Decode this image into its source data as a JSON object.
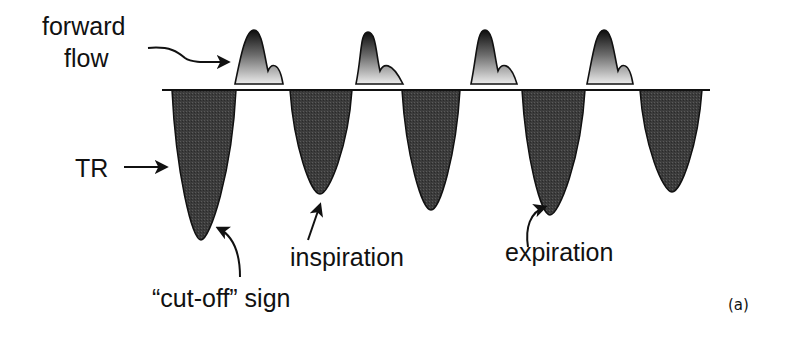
{
  "figure": {
    "panel_label": "(a)",
    "labels": {
      "forward_flow_line1": "forward",
      "forward_flow_line2": "flow",
      "tr": "TR",
      "cut_off_sign": "“cut-off” sign",
      "inspiration": "inspiration",
      "expiration": "expiration"
    },
    "colors": {
      "trough_fill": "#3a3a3a",
      "peak_fill_top": "#111111",
      "peak_fill_bottom": "#e6e6e6",
      "line": "#111111",
      "background": "#ffffff"
    },
    "baseline": {
      "x_start": 162,
      "x_end": 710,
      "y": 90
    },
    "forward_flow_peaks": [
      {
        "left": 235,
        "peak_x": 254,
        "peak_y": 30,
        "notch_x": 268,
        "hump_x": 276,
        "right": 283
      },
      {
        "left": 356,
        "peak_x": 368,
        "peak_y": 32,
        "notch_x": 380,
        "hump_x": 388,
        "right": 403
      },
      {
        "left": 471,
        "peak_x": 485,
        "peak_y": 30,
        "notch_x": 498,
        "hump_x": 507,
        "right": 517
      },
      {
        "left": 587,
        "peak_x": 604,
        "peak_y": 30,
        "notch_x": 618,
        "hump_x": 626,
        "right": 633
      }
    ],
    "tr_troughs": [
      {
        "left": 172,
        "right": 236,
        "bottom_x": 201,
        "bottom_y": 240,
        "note": "cut-off sign"
      },
      {
        "left": 290,
        "right": 352,
        "bottom_x": 320,
        "bottom_y": 194,
        "note": "inspiration"
      },
      {
        "left": 402,
        "right": 460,
        "bottom_x": 431,
        "bottom_y": 210
      },
      {
        "left": 522,
        "right": 585,
        "bottom_x": 550,
        "bottom_y": 215,
        "note": "expiration"
      },
      {
        "left": 640,
        "right": 702,
        "bottom_x": 672,
        "bottom_y": 192
      }
    ]
  }
}
